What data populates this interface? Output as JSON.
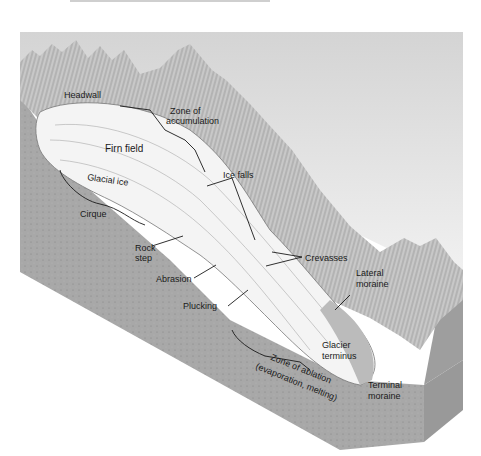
{
  "figure": {
    "colors": {
      "sky": "#d9d9d9",
      "rock_front": "#a9a9a9",
      "rock_side": "#9a9a9a",
      "mountains": "#bdbdbd",
      "ice": "#f4f4f4",
      "ink": "#1a1a1a"
    },
    "labels": {
      "headwall": "Headwall",
      "zone_accumulation_1": "Zone of",
      "zone_accumulation_2": "accumulation",
      "firn_field": "Firn field",
      "glacial_ice": "Glacial ice",
      "cirque": "Cirque",
      "ice_falls": "Ice falls",
      "rock_step_1": "Rock",
      "rock_step_2": "step",
      "abrasion": "Abrasion",
      "crevasses": "Crevasses",
      "plucking": "Plucking",
      "lateral_moraine_1": "Lateral",
      "lateral_moraine_2": "moraine",
      "glacier_terminus_1": "Glacier",
      "glacier_terminus_2": "terminus",
      "zone_ablation_1": "Zone of ablation",
      "zone_ablation_2": "(evaporation, melting)",
      "terminal_moraine_1": "Terminal",
      "terminal_moraine_2": "moraine"
    }
  }
}
